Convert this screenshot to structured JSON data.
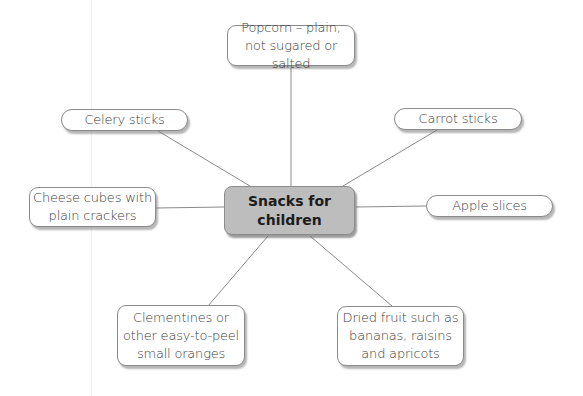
{
  "diagram": {
    "type": "spider-diagram",
    "center": {
      "label": "Snacks for children"
    },
    "nodes": [
      {
        "id": "popcorn",
        "label": "Popcorn – plain, not sugared or salted"
      },
      {
        "id": "celery",
        "label": "Celery sticks"
      },
      {
        "id": "carrot",
        "label": "Carrot sticks"
      },
      {
        "id": "cheese",
        "label": "Cheese cubes with plain crackers"
      },
      {
        "id": "apple",
        "label": "Apple slices"
      },
      {
        "id": "clementines",
        "label": "Clementines or other easy-to-peel small oranges"
      },
      {
        "id": "dried-fruit",
        "label": "Dried fruit such as bananas, raisins and apricots"
      }
    ],
    "colors": {
      "center_fill": "#bdbdbd",
      "node_fill": "#ffffff",
      "line": "#8a8a8a",
      "text": "#3a3a3a"
    }
  }
}
